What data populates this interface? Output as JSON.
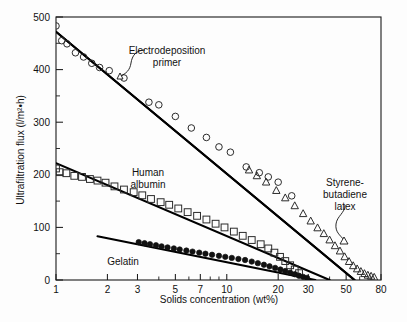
{
  "chart_data": {
    "type": "scatter",
    "title": "",
    "xlabel": "Solids concentration (wt%)",
    "ylabel": "Ultrafiltration flux (l/m²•h)",
    "xscale": "log",
    "yscale": "linear",
    "xlim": [
      1,
      80
    ],
    "ylim": [
      0,
      500
    ],
    "grid": false,
    "legend_position": "in-plot annotations",
    "xticks": [
      1,
      2,
      3,
      5,
      7,
      10,
      20,
      30,
      50,
      80
    ],
    "xticklabels": [
      "1",
      "2",
      "3",
      "5",
      "7",
      "10",
      "20",
      "30",
      "50",
      "80"
    ],
    "yticks": [
      0,
      100,
      200,
      300,
      400,
      500
    ],
    "yticklabels": [
      "0",
      "100",
      "200",
      "300",
      "400",
      "500"
    ],
    "yminorticks": [
      50,
      150,
      250,
      350,
      450
    ],
    "annotations": [
      {
        "name": "electrodeposition-primer",
        "text": "Electrodeposition primer",
        "lines": [
          "Electrodeposition",
          "primer"
        ]
      },
      {
        "name": "human-albumin",
        "text": "Human albumin",
        "lines": [
          "Human",
          "albumin"
        ]
      },
      {
        "name": "gelatin",
        "text": "Gelatin",
        "lines": [
          "Gelatin"
        ]
      },
      {
        "name": "styrene-butadiene-latex",
        "text": "Styrene-butadiene latex",
        "lines": [
          "Styrene-",
          "butadiene",
          "latex"
        ]
      }
    ],
    "series": [
      {
        "name": "Electrodeposition primer",
        "marker": "open-circle",
        "color": "#2b2b2b",
        "fit_line": {
          "x": [
            1.0,
            56.0
          ],
          "y": [
            472,
            0
          ]
        },
        "points": [
          {
            "x": 1.0,
            "y": 483
          },
          {
            "x": 1.08,
            "y": 455
          },
          {
            "x": 1.16,
            "y": 449
          },
          {
            "x": 1.3,
            "y": 432
          },
          {
            "x": 1.45,
            "y": 424
          },
          {
            "x": 1.62,
            "y": 412
          },
          {
            "x": 1.8,
            "y": 404
          },
          {
            "x": 2.05,
            "y": 398
          },
          {
            "x": 2.5,
            "y": 384
          },
          {
            "x": 3.5,
            "y": 338
          },
          {
            "x": 4.0,
            "y": 333
          },
          {
            "x": 5.0,
            "y": 311
          },
          {
            "x": 6.2,
            "y": 289
          },
          {
            "x": 7.6,
            "y": 271
          },
          {
            "x": 9.0,
            "y": 253
          },
          {
            "x": 10.5,
            "y": 243
          },
          {
            "x": 13.0,
            "y": 215
          },
          {
            "x": 15.5,
            "y": 204
          },
          {
            "x": 17.5,
            "y": 196
          },
          {
            "x": 20.0,
            "y": 186
          },
          {
            "x": 24.0,
            "y": 160
          }
        ]
      },
      {
        "name": "Styrene-butadiene latex",
        "marker": "open-triangle",
        "color": "#2b2b2b",
        "fit_line": {
          "x": [
            1.0,
            56.0
          ],
          "y": [
            472,
            0
          ]
        },
        "points": [
          {
            "x": 13.5,
            "y": 209
          },
          {
            "x": 15.0,
            "y": 198
          },
          {
            "x": 17.0,
            "y": 186
          },
          {
            "x": 19.5,
            "y": 170
          },
          {
            "x": 22.0,
            "y": 156
          },
          {
            "x": 25.0,
            "y": 141
          },
          {
            "x": 28.0,
            "y": 126
          },
          {
            "x": 31.0,
            "y": 112
          },
          {
            "x": 34.0,
            "y": 99
          },
          {
            "x": 37.0,
            "y": 88
          },
          {
            "x": 40.0,
            "y": 76
          },
          {
            "x": 43.0,
            "y": 65
          },
          {
            "x": 46.0,
            "y": 55
          },
          {
            "x": 49.0,
            "y": 44
          },
          {
            "x": 52.0,
            "y": 35
          },
          {
            "x": 55.0,
            "y": 27
          },
          {
            "x": 58.0,
            "y": 21
          },
          {
            "x": 61.0,
            "y": 16
          },
          {
            "x": 64.0,
            "y": 12
          },
          {
            "x": 67.0,
            "y": 9
          },
          {
            "x": 70.0,
            "y": 7
          },
          {
            "x": 73.0,
            "y": 5
          }
        ]
      },
      {
        "name": "Human albumin",
        "marker": "open-square",
        "color": "#3a3a3a",
        "fit_line": {
          "x": [
            1.0,
            40.0
          ],
          "y": [
            222,
            0
          ]
        },
        "points": [
          {
            "x": 1.0,
            "y": 212
          },
          {
            "x": 1.05,
            "y": 205
          },
          {
            "x": 1.15,
            "y": 203
          },
          {
            "x": 1.28,
            "y": 198
          },
          {
            "x": 1.42,
            "y": 196
          },
          {
            "x": 1.58,
            "y": 192
          },
          {
            "x": 1.75,
            "y": 189
          },
          {
            "x": 1.95,
            "y": 185
          },
          {
            "x": 2.2,
            "y": 178
          },
          {
            "x": 2.5,
            "y": 172
          },
          {
            "x": 2.85,
            "y": 167
          },
          {
            "x": 3.2,
            "y": 161
          },
          {
            "x": 3.6,
            "y": 154
          },
          {
            "x": 4.1,
            "y": 148
          },
          {
            "x": 4.6,
            "y": 143
          },
          {
            "x": 5.2,
            "y": 136
          },
          {
            "x": 5.9,
            "y": 129
          },
          {
            "x": 6.7,
            "y": 122
          },
          {
            "x": 7.6,
            "y": 115
          },
          {
            "x": 8.6,
            "y": 107
          },
          {
            "x": 9.7,
            "y": 100
          },
          {
            "x": 11.0,
            "y": 92
          },
          {
            "x": 12.4,
            "y": 84
          },
          {
            "x": 14.0,
            "y": 76
          },
          {
            "x": 15.8,
            "y": 68
          },
          {
            "x": 17.5,
            "y": 60
          },
          {
            "x": 19.0,
            "y": 52
          },
          {
            "x": 20.5,
            "y": 44
          },
          {
            "x": 22.0,
            "y": 36
          },
          {
            "x": 23.5,
            "y": 28
          },
          {
            "x": 25.0,
            "y": 20
          },
          {
            "x": 26.5,
            "y": 13
          }
        ]
      },
      {
        "name": "Gelatin",
        "marker": "filled-circle",
        "color": "#111111",
        "fit_line": {
          "x": [
            1.75,
            33.0
          ],
          "y": [
            83,
            0
          ]
        },
        "points": [
          {
            "x": 3.05,
            "y": 72
          },
          {
            "x": 3.3,
            "y": 70
          },
          {
            "x": 3.55,
            "y": 68
          },
          {
            "x": 3.85,
            "y": 66
          },
          {
            "x": 4.15,
            "y": 64
          },
          {
            "x": 4.5,
            "y": 62
          },
          {
            "x": 4.9,
            "y": 60
          },
          {
            "x": 5.3,
            "y": 58
          },
          {
            "x": 5.8,
            "y": 56
          },
          {
            "x": 6.3,
            "y": 54
          },
          {
            "x": 6.9,
            "y": 52
          },
          {
            "x": 7.5,
            "y": 50
          },
          {
            "x": 8.2,
            "y": 48
          },
          {
            "x": 9.0,
            "y": 46
          },
          {
            "x": 9.8,
            "y": 44
          },
          {
            "x": 10.7,
            "y": 42
          },
          {
            "x": 11.7,
            "y": 40
          },
          {
            "x": 12.8,
            "y": 38
          },
          {
            "x": 14.0,
            "y": 35
          },
          {
            "x": 15.2,
            "y": 32
          },
          {
            "x": 16.5,
            "y": 29
          },
          {
            "x": 17.8,
            "y": 26
          },
          {
            "x": 19.2,
            "y": 23
          },
          {
            "x": 20.6,
            "y": 20
          },
          {
            "x": 22.0,
            "y": 17
          },
          {
            "x": 23.5,
            "y": 14
          },
          {
            "x": 25.0,
            "y": 11
          },
          {
            "x": 26.5,
            "y": 8
          },
          {
            "x": 28.0,
            "y": 6
          },
          {
            "x": 29.5,
            "y": 4
          }
        ]
      }
    ]
  }
}
